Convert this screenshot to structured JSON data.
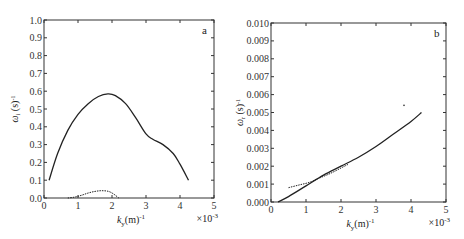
{
  "chart_data": [
    {
      "type": "line",
      "panel": "a",
      "title": "",
      "panel_label": "a",
      "xlabel": "k_y (m)^-1",
      "x_multiplier": "×10^-3",
      "ylabel": "ω_i (s)^-1",
      "xlim": [
        0,
        5
      ],
      "ylim": [
        0,
        1.0
      ],
      "xticks": [
        "0",
        "1",
        "2",
        "3",
        "4",
        "5"
      ],
      "yticks": [
        "0.0",
        "0.1",
        "0.2",
        "0.3",
        "0.4",
        "0.5",
        "0.6",
        "0.7",
        "0.8",
        "0.9",
        "1.0"
      ],
      "grid": false,
      "series": [
        {
          "name": "solid",
          "style": "solid",
          "x": [
            0.15,
            0.4,
            0.7,
            1.0,
            1.3,
            1.6,
            1.88,
            2.1,
            2.4,
            2.7,
            3.0,
            3.2,
            3.5,
            3.8,
            4.0,
            4.25
          ],
          "y": [
            0.1,
            0.25,
            0.38,
            0.47,
            0.53,
            0.57,
            0.585,
            0.575,
            0.53,
            0.45,
            0.36,
            0.33,
            0.3,
            0.25,
            0.19,
            0.1
          ]
        },
        {
          "name": "dashed",
          "style": "dashed",
          "x": [
            0.7,
            0.9,
            1.1,
            1.3,
            1.5,
            1.7,
            1.9,
            2.05,
            2.2
          ],
          "y": [
            0.0,
            0.005,
            0.015,
            0.028,
            0.037,
            0.041,
            0.037,
            0.022,
            0.0
          ]
        }
      ]
    },
    {
      "type": "line",
      "panel": "b",
      "title": "",
      "panel_label": "b",
      "xlabel": "k_y (m)^-1",
      "x_multiplier": "×10^-3",
      "ylabel": "ω_r (s)^-1",
      "xlim": [
        0,
        5
      ],
      "ylim": [
        0,
        0.01
      ],
      "xticks": [
        "0",
        "1",
        "2",
        "3",
        "4",
        "5"
      ],
      "yticks": [
        "0.000",
        "0.001",
        "0.002",
        "0.003",
        "0.004",
        "0.005",
        "0.006",
        "0.007",
        "0.008",
        "0.009",
        "0.010"
      ],
      "grid": false,
      "series": [
        {
          "name": "solid",
          "style": "solid",
          "x": [
            0.2,
            0.5,
            1.0,
            1.5,
            2.0,
            2.5,
            3.0,
            3.5,
            4.0,
            4.3
          ],
          "y": [
            0.0,
            0.0003,
            0.0009,
            0.0015,
            0.002,
            0.0025,
            0.0031,
            0.0038,
            0.0045,
            0.005
          ],
          "style_note": "solid line"
        },
        {
          "name": "dashed",
          "style": "dashed",
          "x": [
            0.5,
            0.8,
            1.1,
            1.4,
            1.7,
            2.0,
            2.2
          ],
          "y": [
            0.0008,
            0.00095,
            0.0011,
            0.00135,
            0.0016,
            0.0019,
            0.0021
          ]
        },
        {
          "name": "stray-point",
          "style": "point",
          "x": [
            3.8
          ],
          "y": [
            0.0054
          ]
        }
      ]
    }
  ],
  "layout": {
    "panels": [
      {
        "left": 44,
        "top": 20,
        "right": 214,
        "bottom": 198
      },
      {
        "left": 271,
        "top": 23,
        "right": 446,
        "bottom": 202
      }
    ],
    "line_color": "#222222",
    "axis_color": "#333333"
  }
}
